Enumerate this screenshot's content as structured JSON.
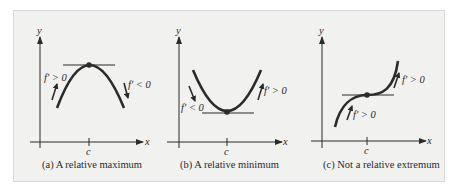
{
  "figure": {
    "background_color": "#f1f1f0",
    "curve_color": "#2b2b2b",
    "panels": [
      {
        "id": "a",
        "caption": "(a) A relative maximum",
        "axis_x_label": "x",
        "axis_y_label": "y",
        "tick_label": "c",
        "left_annotation": "f′ > 0",
        "right_annotation": "f′ < 0",
        "type": "relative-maximum"
      },
      {
        "id": "b",
        "caption": "(b) A relative minimum",
        "axis_x_label": "x",
        "axis_y_label": "y",
        "tick_label": "c",
        "left_annotation": "f′ < 0",
        "right_annotation": "f′ > 0",
        "type": "relative-minimum"
      },
      {
        "id": "c",
        "caption": "(c) Not a relative extremum",
        "axis_x_label": "x",
        "axis_y_label": "y",
        "tick_label": "c",
        "left_annotation": "f′ > 0",
        "right_annotation": "f′ > 0",
        "type": "not-extremum"
      }
    ]
  }
}
